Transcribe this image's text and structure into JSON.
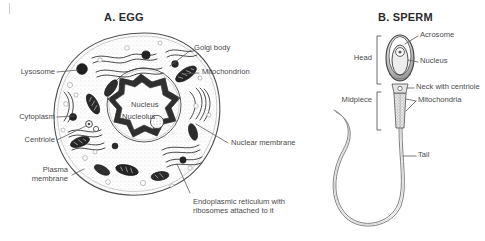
{
  "figure": {
    "panels": [
      {
        "id": "egg",
        "title": "A. EGG",
        "labels": {
          "lysosome": "Lysosome",
          "cytoplasm": "Cytoplasm",
          "centriole": "Centriole",
          "plasma_membrane_line1": "Plasma",
          "plasma_membrane_line2": "membrane",
          "nucleus": "Nucleus",
          "nucleolus": "Nucleolus",
          "golgi_body": "Golgi body",
          "mitochondrion": "Mitochondrion",
          "nuclear_membrane": "Nuclear membrane",
          "endoplasmic_reticulum": "Endoplasmic reticulum with ribosomes attached to it"
        }
      },
      {
        "id": "sperm",
        "title": "B. SPERM",
        "labels": {
          "head": "Head",
          "midpiece": "Midpiece",
          "acrosome": "Acrosome",
          "nucleus": "Nucleus",
          "neck_with_centriole": "Neck with centriole",
          "mitochondria": "Mitochondria",
          "tail": "Tail"
        }
      }
    ]
  },
  "style": {
    "background": "#ffffff",
    "ink": "#3b3b3b",
    "label_color": "#4a4a4a",
    "title_color": "#2b2b2b"
  }
}
